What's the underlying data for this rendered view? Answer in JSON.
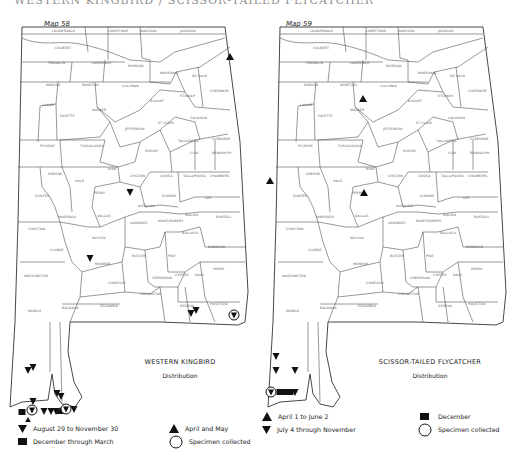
{
  "page": {
    "title": "WESTERN KINGBIRD / SCISSOR-TAILED FLYCATCHER"
  },
  "maps": [
    {
      "label": "Map 58",
      "species": "WESTERN KINGBIRD",
      "subtitle": "Distribution",
      "legend": [
        {
          "symbol": "triangle-down",
          "label": "August 29 to November 30"
        },
        {
          "symbol": "square",
          "label": "December through March"
        },
        {
          "symbol": "triangle-up",
          "label": "April and May"
        },
        {
          "symbol": "circle",
          "label": "Specimen collected"
        }
      ]
    },
    {
      "label": "Map 59",
      "species": "SCISSOR-TAILED FLYCATCHER",
      "subtitle": "Distribution",
      "legend": [
        {
          "symbol": "triangle-up",
          "label": "April 1 to June 2"
        },
        {
          "symbol": "triangle-down",
          "label": "July 4 through November"
        },
        {
          "symbol": "square",
          "label": "December"
        },
        {
          "symbol": "circle",
          "label": "Specimen collected"
        }
      ]
    }
  ],
  "counties": [
    {
      "name": "LAUDERDALE",
      "x": 52,
      "y": 10
    },
    {
      "name": "LIMESTONE",
      "x": 108,
      "y": 10
    },
    {
      "name": "MADISON",
      "x": 140,
      "y": 10
    },
    {
      "name": "JACKSON",
      "x": 180,
      "y": 10
    },
    {
      "name": "COLBERT",
      "x": 55,
      "y": 27
    },
    {
      "name": "FRANKLIN",
      "x": 48,
      "y": 42
    },
    {
      "name": "LAWRENCE",
      "x": 92,
      "y": 42
    },
    {
      "name": "MORGAN",
      "x": 128,
      "y": 45
    },
    {
      "name": "MARSHALL",
      "x": 160,
      "y": 52
    },
    {
      "name": "DE KALB",
      "x": 192,
      "y": 55
    },
    {
      "name": "MARION",
      "x": 46,
      "y": 64
    },
    {
      "name": "WINSTON",
      "x": 82,
      "y": 64
    },
    {
      "name": "CULLMAN",
      "x": 122,
      "y": 65
    },
    {
      "name": "BLOUNT",
      "x": 150,
      "y": 80
    },
    {
      "name": "ETOWAH",
      "x": 180,
      "y": 75
    },
    {
      "name": "CHEROKEE",
      "x": 210,
      "y": 70
    },
    {
      "name": "LAMAR",
      "x": 42,
      "y": 84
    },
    {
      "name": "FAYETTE",
      "x": 60,
      "y": 95
    },
    {
      "name": "WALKER",
      "x": 92,
      "y": 89
    },
    {
      "name": "JEFFERSON",
      "x": 125,
      "y": 108
    },
    {
      "name": "ST CLAIR",
      "x": 158,
      "y": 102
    },
    {
      "name": "CALHOUN",
      "x": 190,
      "y": 97
    },
    {
      "name": "CLEBURNE",
      "x": 212,
      "y": 118
    },
    {
      "name": "PICKENS",
      "x": 40,
      "y": 125
    },
    {
      "name": "TUSCALOOSA",
      "x": 80,
      "y": 125
    },
    {
      "name": "SHELBY",
      "x": 145,
      "y": 130
    },
    {
      "name": "TALLADEGA",
      "x": 178,
      "y": 120
    },
    {
      "name": "CLAY",
      "x": 190,
      "y": 132
    },
    {
      "name": "RANDOLPH",
      "x": 212,
      "y": 132
    },
    {
      "name": "GREENE",
      "x": 48,
      "y": 153
    },
    {
      "name": "BIBB",
      "x": 108,
      "y": 148
    },
    {
      "name": "CHILTON",
      "x": 130,
      "y": 155
    },
    {
      "name": "COOSA",
      "x": 160,
      "y": 155
    },
    {
      "name": "TALLAPOOSA",
      "x": 183,
      "y": 155
    },
    {
      "name": "CHAMBERS",
      "x": 210,
      "y": 155
    },
    {
      "name": "HALE",
      "x": 75,
      "y": 160
    },
    {
      "name": "SUMTER",
      "x": 35,
      "y": 175
    },
    {
      "name": "PERRY",
      "x": 94,
      "y": 172
    },
    {
      "name": "ELMORE",
      "x": 162,
      "y": 175
    },
    {
      "name": "LEE",
      "x": 205,
      "y": 177
    },
    {
      "name": "AUTAUGA",
      "x": 138,
      "y": 185
    },
    {
      "name": "MARENGO",
      "x": 58,
      "y": 196
    },
    {
      "name": "DALLAS",
      "x": 97,
      "y": 195
    },
    {
      "name": "MACON",
      "x": 185,
      "y": 194
    },
    {
      "name": "RUSSELL",
      "x": 216,
      "y": 196
    },
    {
      "name": "LOWNDES",
      "x": 130,
      "y": 202
    },
    {
      "name": "MONTGOMERY",
      "x": 158,
      "y": 200
    },
    {
      "name": "CHOCTAW",
      "x": 28,
      "y": 208
    },
    {
      "name": "BULLOCK",
      "x": 182,
      "y": 212
    },
    {
      "name": "WILCOX",
      "x": 92,
      "y": 217
    },
    {
      "name": "CLARKE",
      "x": 50,
      "y": 229
    },
    {
      "name": "BARBOUR",
      "x": 208,
      "y": 226
    },
    {
      "name": "BUTLER",
      "x": 132,
      "y": 235
    },
    {
      "name": "PIKE",
      "x": 168,
      "y": 235
    },
    {
      "name": "MONROE",
      "x": 95,
      "y": 243
    },
    {
      "name": "WASHINGTON",
      "x": 24,
      "y": 255
    },
    {
      "name": "HENRY",
      "x": 213,
      "y": 248
    },
    {
      "name": "CRENSHAW",
      "x": 152,
      "y": 257
    },
    {
      "name": "COFFEE",
      "x": 175,
      "y": 254
    },
    {
      "name": "DALE",
      "x": 195,
      "y": 254
    },
    {
      "name": "CONECUH",
      "x": 108,
      "y": 262
    },
    {
      "name": "COVINGTON",
      "x": 140,
      "y": 273
    },
    {
      "name": "ESCAMBIA",
      "x": 100,
      "y": 285
    },
    {
      "name": "GENEVA",
      "x": 180,
      "y": 285
    },
    {
      "name": "HOUSTON",
      "x": 210,
      "y": 283
    },
    {
      "name": "MOBILE",
      "x": 28,
      "y": 290
    },
    {
      "name": "BALDWIN",
      "x": 62,
      "y": 287
    }
  ],
  "map58_points": [
    {
      "type": "triangle-up",
      "x": 230,
      "y": 35
    },
    {
      "type": "triangle-down",
      "x": 130,
      "y": 170
    },
    {
      "type": "triangle-down",
      "x": 90,
      "y": 236
    },
    {
      "type": "triangle-down",
      "x": 191,
      "y": 291
    },
    {
      "type": "triangle-down",
      "x": 196,
      "y": 288
    },
    {
      "type": "circle-down",
      "x": 234,
      "y": 293
    },
    {
      "type": "triangle-down",
      "x": 28,
      "y": 348
    },
    {
      "type": "triangle-down",
      "x": 33,
      "y": 345
    },
    {
      "type": "triangle-down",
      "x": 57,
      "y": 371
    },
    {
      "type": "triangle-down",
      "x": 61,
      "y": 374
    },
    {
      "type": "triangle-down",
      "x": 33,
      "y": 379
    },
    {
      "type": "square",
      "x": 22,
      "y": 390
    },
    {
      "type": "circle-down",
      "x": 32,
      "y": 388
    },
    {
      "type": "triangle-up",
      "x": 28,
      "y": 399
    },
    {
      "type": "triangle-down",
      "x": 44,
      "y": 389
    },
    {
      "type": "triangle-down",
      "x": 51,
      "y": 389
    },
    {
      "type": "triangle-down",
      "x": 56,
      "y": 389
    },
    {
      "type": "triangle-up",
      "x": 60,
      "y": 389
    },
    {
      "type": "circle-down",
      "x": 66,
      "y": 387
    },
    {
      "type": "triangle-down",
      "x": 74,
      "y": 387
    }
  ],
  "map59_points": [
    {
      "type": "triangle-up",
      "x": 105,
      "y": 77
    },
    {
      "type": "triangle-up",
      "x": 12,
      "y": 159
    },
    {
      "type": "triangle-up",
      "x": 106,
      "y": 171
    },
    {
      "type": "triangle-down",
      "x": 18,
      "y": 334
    },
    {
      "type": "triangle-down",
      "x": 18,
      "y": 348
    },
    {
      "type": "triangle-down",
      "x": 37,
      "y": 348
    },
    {
      "type": "circle-down",
      "x": 13,
      "y": 370
    },
    {
      "type": "square",
      "x": 22,
      "y": 370
    },
    {
      "type": "square",
      "x": 27,
      "y": 370
    },
    {
      "type": "square",
      "x": 32,
      "y": 370
    },
    {
      "type": "triangle-down",
      "x": 37,
      "y": 370
    }
  ]
}
